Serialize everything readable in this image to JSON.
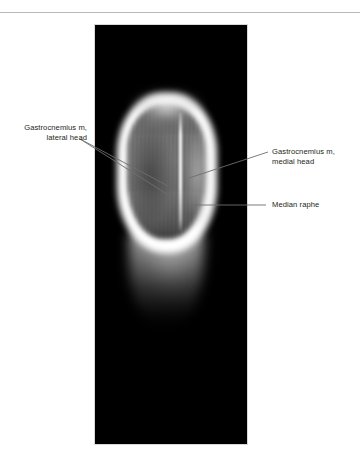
{
  "figure": {
    "modality_caption": "axial cross-sectional image of the calf",
    "panel": {
      "name": "scan-panel",
      "background_color": "#000000",
      "x": 95,
      "y": 25,
      "width": 152,
      "height": 419
    },
    "page_background": "#ffffff",
    "rule_color": "#b9b9b9",
    "label_text_color": "#231f20",
    "leader_line_color": "#6e6e6e"
  },
  "annotations": [
    {
      "id": "lateral-head",
      "side": "left",
      "align": "right",
      "lines": [
        "Gastrocnemius m,",
        "lateral head"
      ],
      "leader_count": 2
    },
    {
      "id": "medial-head",
      "side": "right",
      "align": "left",
      "lines": [
        "Gastrocnemius m,",
        "medial head"
      ],
      "leader_count": 1
    },
    {
      "id": "median-raphe",
      "side": "right",
      "align": "left",
      "lines": [
        "Median raphe"
      ],
      "leader_count": 1
    }
  ],
  "structures": [
    {
      "id": "lateral-head-belly",
      "label": "Gastrocnemius m, lateral head"
    },
    {
      "id": "medial-head-belly",
      "label": "Gastrocnemius m, medial head"
    },
    {
      "id": "median-raphe-septum",
      "label": "Median raphe"
    }
  ]
}
